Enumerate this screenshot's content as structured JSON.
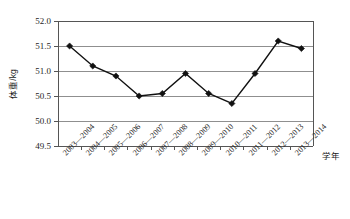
{
  "chart_data": {
    "type": "line",
    "title": "",
    "subtitle": "",
    "xlabel": "学年",
    "ylabel": "体重/kg",
    "categories": [
      "2003—2004",
      "2004—2005",
      "2005—2006",
      "2006—2007",
      "2007—2008",
      "2008—2009",
      "2009—2010",
      "2010—2011",
      "2011—2012",
      "2012—2013",
      "2013—2014"
    ],
    "values": [
      51.5,
      51.1,
      50.9,
      50.5,
      50.55,
      50.95,
      50.55,
      50.35,
      50.95,
      51.6,
      51.45
    ],
    "series": [
      {
        "name": "体重",
        "values": [
          51.5,
          51.1,
          50.9,
          50.5,
          50.55,
          50.95,
          50.55,
          50.35,
          50.95,
          51.6,
          51.45
        ]
      }
    ],
    "ylim": [
      49.5,
      52.0
    ],
    "ytick_labels": [
      "52.0",
      "51.5",
      "51.0",
      "50.5",
      "50.0",
      "49.5"
    ],
    "ytick_values": [
      52.0,
      51.5,
      51.0,
      50.5,
      50.0,
      49.5
    ],
    "grid": true,
    "legend": "none",
    "marker": "diamond",
    "line_color": "#111111",
    "marker_color": "#111111",
    "grid_color": "#8f8f8f",
    "axis_color": "#555555",
    "background_color": "#ffffff"
  }
}
